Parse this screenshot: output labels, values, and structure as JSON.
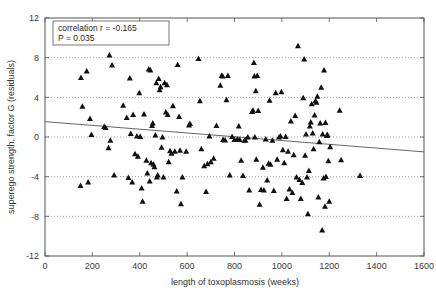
{
  "chart_data": {
    "type": "scatter",
    "title": "",
    "xlabel": "length of toxoplasmosis (weeks)",
    "ylabel": "superego strength, factor G (residuals)",
    "xlim": [
      0,
      1600
    ],
    "ylim": [
      -12,
      12
    ],
    "xticks": [
      0,
      200,
      400,
      600,
      800,
      1000,
      1200,
      1400,
      1600
    ],
    "yticks": [
      -12,
      -8,
      -4,
      0,
      4,
      8,
      12
    ],
    "grid": {
      "horizontal_dotted_at": [
        8,
        4,
        0,
        -4,
        -8
      ],
      "vertical": false
    },
    "legend": "none",
    "marker": {
      "shape": "triangle-up",
      "color": "#101010",
      "size": 5
    },
    "annotations": [
      {
        "name": "stats-box",
        "line1": "correlation  r = -0.165",
        "line2": "P = 0.035",
        "border_color": "#555555",
        "background": "#ffffff"
      }
    ],
    "trendline": {
      "name": "regression-line",
      "color": "#555555",
      "x": [
        0,
        1600
      ],
      "y": [
        1.55,
        -1.5
      ]
    },
    "series": [
      {
        "name": "superego residuals",
        "points": [
          [
            152,
            6.0
          ],
          [
            158,
            3.1
          ],
          [
            150,
            -4.9
          ],
          [
            176,
            6.65
          ],
          [
            182,
            -4.55
          ],
          [
            190,
            1.85
          ],
          [
            196,
            0.25
          ],
          [
            250,
            1.05
          ],
          [
            256,
            0.95
          ],
          [
            268,
            -1.1
          ],
          [
            272,
            8.25
          ],
          [
            276,
            -0.35
          ],
          [
            283,
            7.25
          ],
          [
            292,
            -3.85
          ],
          [
            330,
            3.2
          ],
          [
            345,
            1.95
          ],
          [
            352,
            -4.1
          ],
          [
            358,
            5.95
          ],
          [
            362,
            0.35
          ],
          [
            368,
            -4.55
          ],
          [
            372,
            2.25
          ],
          [
            380,
            -1.7
          ],
          [
            388,
            0.1
          ],
          [
            392,
            -1.95
          ],
          [
            398,
            4.45
          ],
          [
            402,
            0.05
          ],
          [
            408,
            -5.15
          ],
          [
            412,
            -6.5
          ],
          [
            418,
            2.3
          ],
          [
            428,
            -2.35
          ],
          [
            432,
            -3.65
          ],
          [
            438,
            6.85
          ],
          [
            442,
            -4.45
          ],
          [
            445,
            6.75
          ],
          [
            448,
            -2.6
          ],
          [
            452,
            1.15
          ],
          [
            455,
            1.4
          ],
          [
            458,
            -2.75
          ],
          [
            462,
            -3.0
          ],
          [
            466,
            0.2
          ],
          [
            470,
            5.45
          ],
          [
            472,
            -4.05
          ],
          [
            476,
            -3.85
          ],
          [
            480,
            5.9
          ],
          [
            484,
            4.75
          ],
          [
            488,
            5.05
          ],
          [
            492,
            -1.05
          ],
          [
            496,
            0.0
          ],
          [
            500,
            -4.05
          ],
          [
            505,
            5.45
          ],
          [
            510,
            2.5
          ],
          [
            515,
            5.25
          ],
          [
            518,
            2.25
          ],
          [
            522,
            -2.5
          ],
          [
            528,
            -1.4
          ],
          [
            534,
            -1.65
          ],
          [
            540,
            3.15
          ],
          [
            548,
            -1.45
          ],
          [
            556,
            -5.45
          ],
          [
            560,
            7.3
          ],
          [
            566,
            2.05
          ],
          [
            570,
            -1.35
          ],
          [
            574,
            -6.75
          ],
          [
            580,
            -4.05
          ],
          [
            596,
            -1.45
          ],
          [
            608,
            1.2
          ],
          [
            612,
            1.35
          ],
          [
            648,
            7.9
          ],
          [
            654,
            3.65
          ],
          [
            660,
            -1.2
          ],
          [
            672,
            -2.9
          ],
          [
            680,
            -5.5
          ],
          [
            686,
            -2.7
          ],
          [
            694,
            0.1
          ],
          [
            700,
            -2.5
          ],
          [
            712,
            -2.15
          ],
          [
            724,
            1.15
          ],
          [
            740,
            5.2
          ],
          [
            746,
            6.2
          ],
          [
            750,
            6.15
          ],
          [
            752,
            -0.25
          ],
          [
            760,
            -0.3
          ],
          [
            766,
            3.75
          ],
          [
            772,
            6.2
          ],
          [
            780,
            -3.85
          ],
          [
            790,
            0.05
          ],
          [
            800,
            -0.25
          ],
          [
            812,
            -0.2
          ],
          [
            818,
            1.1
          ],
          [
            822,
            -0.25
          ],
          [
            828,
            -2.35
          ],
          [
            836,
            -3.9
          ],
          [
            842,
            -0.35
          ],
          [
            846,
            -0.3
          ],
          [
            856,
            0.0
          ],
          [
            862,
            -5.35
          ],
          [
            874,
            2.55
          ],
          [
            878,
            2.7
          ],
          [
            882,
            7.5
          ],
          [
            884,
            6.15
          ],
          [
            886,
            0.0
          ],
          [
            890,
            4.65
          ],
          [
            892,
            -2.25
          ],
          [
            896,
            6.2
          ],
          [
            900,
            2.65
          ],
          [
            906,
            -6.8
          ],
          [
            912,
            -5.3
          ],
          [
            920,
            -3.05
          ],
          [
            924,
            -5.35
          ],
          [
            932,
            -0.2
          ],
          [
            938,
            -4.35
          ],
          [
            944,
            -2.65
          ],
          [
            948,
            3.7
          ],
          [
            952,
            -2.75
          ],
          [
            960,
            -0.35
          ],
          [
            966,
            -5.4
          ],
          [
            974,
            4.45
          ],
          [
            980,
            -2.25
          ],
          [
            988,
            0.0
          ],
          [
            994,
            0.1
          ],
          [
            998,
            4.55
          ],
          [
            1004,
            -1.3
          ],
          [
            1010,
            -2.6
          ],
          [
            1016,
            0.05
          ],
          [
            1020,
            -6.2
          ],
          [
            1026,
            -1.45
          ],
          [
            1032,
            -5.25
          ],
          [
            1038,
            1.6
          ],
          [
            1044,
            -5.6
          ],
          [
            1050,
            -1.8
          ],
          [
            1056,
            2.15
          ],
          [
            1062,
            -4.05
          ],
          [
            1068,
            9.2
          ],
          [
            1074,
            -4.3
          ],
          [
            1080,
            -6.2
          ],
          [
            1086,
            -4.6
          ],
          [
            1090,
            3.95
          ],
          [
            1094,
            7.85
          ],
          [
            1098,
            -1.85
          ],
          [
            1102,
            0.3
          ],
          [
            1106,
            -4.05
          ],
          [
            1110,
            -7.75
          ],
          [
            1114,
            -3.4
          ],
          [
            1118,
            1.1
          ],
          [
            1122,
            1.5
          ],
          [
            1126,
            3.35
          ],
          [
            1130,
            0.4
          ],
          [
            1134,
            -1.2
          ],
          [
            1138,
            2.2
          ],
          [
            1142,
            3.65
          ],
          [
            1146,
            3.5
          ],
          [
            1150,
            4.1
          ],
          [
            1154,
            -6.05
          ],
          [
            1158,
            -0.5
          ],
          [
            1162,
            1.4
          ],
          [
            1166,
            5.0
          ],
          [
            1170,
            -9.4
          ],
          [
            1172,
            0.3
          ],
          [
            1176,
            -4.15
          ],
          [
            1178,
            6.75
          ],
          [
            1182,
            -7.0
          ],
          [
            1184,
            1.45
          ],
          [
            1186,
            -4.0
          ],
          [
            1190,
            0.15
          ],
          [
            1192,
            0.25
          ],
          [
            1196,
            -2.4
          ],
          [
            1200,
            -6.5
          ],
          [
            1204,
            -1.0
          ],
          [
            1244,
            2.7
          ],
          [
            1250,
            -2.3
          ],
          [
            1330,
            -3.9
          ]
        ]
      }
    ]
  }
}
